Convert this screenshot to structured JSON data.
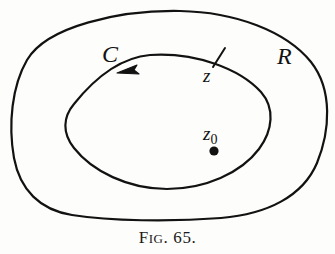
{
  "figure": {
    "caption_prefix": "F",
    "caption_smallcaps": "IG",
    "caption_rest": ". 65.",
    "caption_full": "Fig. 65.",
    "background_color": "#fdfdfb",
    "ink_color": "#121212"
  },
  "labels": {
    "contour_label": "C",
    "region_label": "R",
    "point_on_contour": "z",
    "point_on_contour_prime": "′",
    "interior_point_base": "z",
    "interior_point_subscript": "0",
    "interior_point_full": "z₀"
  },
  "diagram": {
    "type": "complex-analysis-contour",
    "outer_boundary_name": "region-R-boundary",
    "inner_boundary_name": "contour-C",
    "orientation": "counterclockwise",
    "arrow_direction": "left",
    "tick_mark_label": "z-prime-tick",
    "interior_dot_label": "z0-dot",
    "outer_curve_path": "M 180 11 C 235 12 286 31 311 62 C 333 90 330 131 317 163 C 303 196 268 214 221 218 C 170 222 110 221 72 215 C 40 210 20 190 14 158 C 8 124 12 86 27 60 C 47 26 120 10 180 11 Z",
    "inner_curve_path": "M 150 55 C 196 52 240 69 261 92 C 275 108 273 130 259 149 C 241 173 205 189 167 189 C 128 189 92 171 74 148 C 62 133 63 117 74 104 C 90 84 116 58 150 55 Z",
    "arrow_tip": [
      118,
      73
    ],
    "tick_center": [
      219,
      58
    ],
    "dot_center": [
      214,
      151
    ],
    "dot_radius": 4.5,
    "stroke_width": 2.1
  }
}
